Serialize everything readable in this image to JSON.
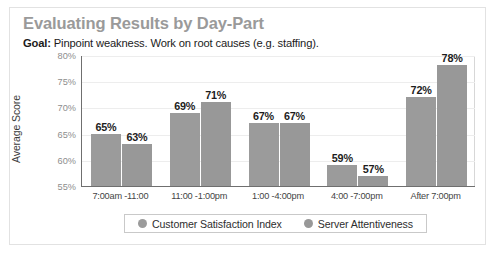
{
  "card": {
    "title": "Evaluating Results by Day-Part",
    "goal_prefix": "Goal:",
    "goal_text": " Pinpoint weakness.  Work on root causes (e.g. staffing)."
  },
  "legend": {
    "items": [
      {
        "label": "Customer Satisfaction Index",
        "color": "#9b9b9b",
        "marker": "circle-marker"
      },
      {
        "label": "Server Attentiveness",
        "color": "#989898",
        "marker": "circle-marker"
      }
    ]
  },
  "chart_data": {
    "type": "bar",
    "title": "Evaluating Results by Day-Part",
    "subtitle": "Goal: Pinpoint weakness.  Work on root causes (e.g. staffing).",
    "xlabel": "",
    "ylabel": "Average Score",
    "ylim": [
      55,
      80
    ],
    "ytick_labels": [
      "80%",
      "75%",
      "70%",
      "65%",
      "60%",
      "55%"
    ],
    "ytick_values": [
      80,
      75,
      70,
      65,
      60,
      55
    ],
    "grid": true,
    "legend_position": "bottom",
    "categories": [
      "7:00am -11:00",
      "11:00 -1:00pm",
      "1:00 -4:00pm",
      "4:00 -7:00pm",
      "After 7:00pm"
    ],
    "series": [
      {
        "name": "Customer Satisfaction Index",
        "color": "#9b9b9b",
        "values": [
          65,
          69,
          67,
          59,
          72
        ],
        "value_labels": [
          "65%",
          "69%",
          "67%",
          "59%",
          "72%"
        ]
      },
      {
        "name": "Server Attentiveness",
        "color": "#989898",
        "values": [
          63,
          71,
          67,
          57,
          78
        ],
        "value_labels": [
          "63%",
          "71%",
          "67%",
          "57%",
          "78%"
        ]
      }
    ]
  }
}
